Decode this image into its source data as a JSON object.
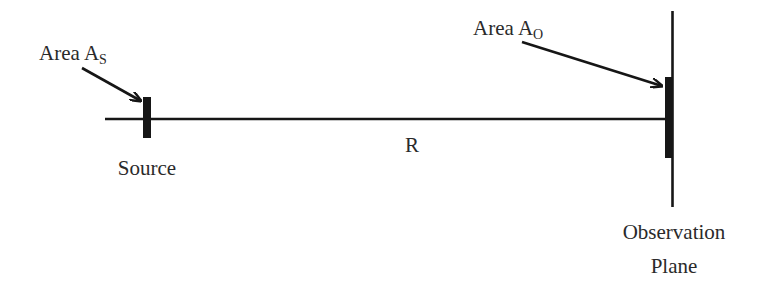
{
  "diagram": {
    "type": "optical-geometry",
    "source": {
      "area_label_prefix": "Area A",
      "area_subscript": "S",
      "name": "Source"
    },
    "observation": {
      "area_label_prefix": "Area A",
      "area_subscript": "O",
      "name_line1": "Observation",
      "name_line2": "Plane"
    },
    "distance_label": "R",
    "colors": {
      "ink": "#161616",
      "text": "#2a2a2a",
      "background": "#ffffff"
    }
  }
}
